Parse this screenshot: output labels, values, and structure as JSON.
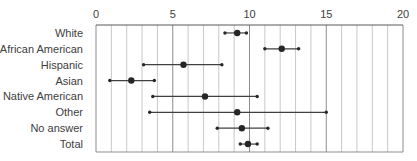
{
  "chart_data": {
    "type": "dot-errorbar",
    "orientation": "horizontal",
    "title": "",
    "xlabel": "",
    "ylabel": "",
    "xlim": [
      0,
      20
    ],
    "x_ticks": [
      0,
      5,
      10,
      15,
      20
    ],
    "x_axis_position": "top",
    "grid": {
      "vertical": true,
      "minor_step": 1,
      "major_step": 5
    },
    "legend": null,
    "categories": [
      "White",
      "African American",
      "Hispanic",
      "Asian",
      "Native American",
      "Other",
      "No answer",
      "Total"
    ],
    "series": [
      {
        "name": "mean",
        "values": [
          9.2,
          12.1,
          5.7,
          2.3,
          7.1,
          9.2,
          9.5,
          9.9
        ]
      },
      {
        "name": "lower",
        "values": [
          8.4,
          11.0,
          3.1,
          0.9,
          3.7,
          3.5,
          7.9,
          9.4
        ]
      },
      {
        "name": "upper",
        "values": [
          9.8,
          13.2,
          8.2,
          3.8,
          10.5,
          15.0,
          11.2,
          10.5
        ]
      }
    ],
    "colors": {
      "marker": "#262626",
      "line": "#404040",
      "grid_minor": "#c8c8c8",
      "grid_major": "#8c8c8c",
      "axis": "#595959",
      "text": "#404040"
    }
  }
}
